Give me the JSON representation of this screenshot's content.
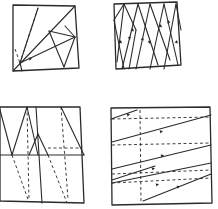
{
  "canvas": {
    "width": 218,
    "height": 209,
    "background": "#ffffff",
    "ink": "#2a2a2a"
  },
  "panels": [
    {
      "id": "top-left",
      "outline": [
        [
          13,
          5
        ],
        [
          75,
          6
        ],
        [
          79,
          68
        ],
        [
          13,
          71
        ]
      ],
      "solid": [
        [
          [
            13,
            71
          ],
          [
            75,
            6
          ]
        ],
        [
          [
            20,
            63
          ],
          [
            38,
            8
          ]
        ],
        [
          [
            49,
            31
          ],
          [
            75,
            37
          ]
        ],
        [
          [
            49,
            31
          ],
          [
            64,
            67
          ]
        ],
        [
          [
            20,
            63
          ],
          [
            75,
            37
          ]
        ],
        [
          [
            75,
            37
          ],
          [
            64,
            67
          ]
        ],
        [
          [
            65,
            26
          ],
          [
            75,
            37
          ]
        ],
        [
          [
            20,
            63
          ],
          [
            22,
            71
          ]
        ]
      ],
      "dashed": [
        [
          [
            38,
            8
          ],
          [
            20,
            63
          ]
        ],
        [
          [
            15,
            49
          ],
          [
            20,
            63
          ]
        ]
      ],
      "arrows": [
        [
          [
            24,
            61
          ],
          [
            32,
            58
          ]
        ]
      ]
    },
    {
      "id": "top-right",
      "outline": [
        [
          114,
          4
        ],
        [
          177,
          2
        ],
        [
          181,
          65
        ],
        [
          116,
          69
        ]
      ],
      "solid": [
        [
          [
            114,
            20
          ],
          [
            124,
            4
          ]
        ],
        [
          [
            114,
            20
          ],
          [
            124,
            69
          ]
        ],
        [
          [
            124,
            4
          ],
          [
            136,
            30
          ]
        ],
        [
          [
            136,
            30
          ],
          [
            129,
            69
          ]
        ],
        [
          [
            124,
            4
          ],
          [
            117,
            62
          ]
        ],
        [
          [
            138,
            4
          ],
          [
            122,
            69
          ]
        ],
        [
          [
            138,
            4
          ],
          [
            158,
            65
          ]
        ],
        [
          [
            150,
            4
          ],
          [
            136,
            69
          ]
        ],
        [
          [
            150,
            4
          ],
          [
            170,
            60
          ]
        ],
        [
          [
            164,
            4
          ],
          [
            150,
            69
          ]
        ],
        [
          [
            164,
            4
          ],
          [
            178,
            65
          ]
        ],
        [
          [
            176,
            4
          ],
          [
            164,
            69
          ]
        ],
        [
          [
            176,
            4
          ],
          [
            181,
            30
          ]
        ]
      ],
      "dashed": [],
      "arrows": [
        [
          [
            119,
            48
          ],
          [
            121,
            40
          ]
        ],
        [
          [
            128,
            32
          ],
          [
            130,
            40
          ]
        ],
        [
          [
            131,
            36
          ],
          [
            133,
            28
          ]
        ],
        [
          [
            141,
            45
          ],
          [
            143,
            37
          ]
        ],
        [
          [
            159,
            32
          ],
          [
            161,
            24
          ]
        ],
        [
          [
            148,
            36
          ],
          [
            150,
            44
          ]
        ],
        [
          [
            175,
            48
          ],
          [
            177,
            40
          ]
        ],
        [
          [
            170,
            28
          ],
          [
            168,
            20
          ]
        ]
      ]
    },
    {
      "id": "bottom-left",
      "outline": [
        [
          0,
          107
        ],
        [
          80,
          107
        ],
        [
          84,
          203
        ],
        [
          0,
          201
        ]
      ],
      "solid": [
        [
          [
            0,
            155
          ],
          [
            84,
            155
          ]
        ],
        [
          [
            0,
            110
          ],
          [
            12,
            155
          ]
        ],
        [
          [
            12,
            155
          ],
          [
            27,
            107
          ]
        ],
        [
          [
            27,
            107
          ],
          [
            38,
            155
          ]
        ],
        [
          [
            38,
            134
          ],
          [
            48,
            155
          ]
        ],
        [
          [
            38,
            134
          ],
          [
            29,
            155
          ]
        ],
        [
          [
            36,
            107
          ],
          [
            42,
            203
          ]
        ],
        [
          [
            61,
            107
          ],
          [
            84,
            155
          ]
        ]
      ],
      "dashed": [
        [
          [
            12,
            155
          ],
          [
            29,
            202
          ]
        ],
        [
          [
            48,
            155
          ],
          [
            67,
            203
          ]
        ],
        [
          [
            61,
            107
          ],
          [
            68,
            199
          ]
        ],
        [
          [
            48,
            148
          ],
          [
            82,
            148
          ]
        ],
        [
          [
            27,
            107
          ],
          [
            29,
            200
          ]
        ]
      ],
      "arrows": []
    },
    {
      "id": "bottom-right",
      "outline": [
        [
          111,
          108
        ],
        [
          210,
          107
        ],
        [
          212,
          203
        ],
        [
          112,
          205
        ]
      ],
      "solid": [
        [
          [
            111,
            119
          ],
          [
            137,
            110
          ]
        ],
        [
          [
            112,
            142
          ],
          [
            211,
            115
          ]
        ],
        [
          [
            112,
            169
          ],
          [
            211,
            145
          ]
        ],
        [
          [
            112,
            180
          ],
          [
            155,
            166
          ]
        ],
        [
          [
            112,
            183
          ],
          [
            211,
            163
          ]
        ],
        [
          [
            143,
            201
          ],
          [
            211,
            174
          ]
        ]
      ],
      "dashed": [
        [
          [
            140,
            110
          ],
          [
            141,
            203
          ]
        ],
        [
          [
            112,
            119
          ],
          [
            211,
            117
          ]
        ],
        [
          [
            112,
            145
          ],
          [
            211,
            143
          ]
        ],
        [
          [
            112,
            174
          ],
          [
            211,
            170
          ]
        ],
        [
          [
            112,
            183
          ],
          [
            211,
            178
          ]
        ]
      ],
      "arrows": [
        [
          [
            122,
            117
          ],
          [
            130,
            114
          ]
        ],
        [
          [
            156,
            133
          ],
          [
            163,
            131
          ]
        ],
        [
          [
            156,
            158
          ],
          [
            164,
            155
          ]
        ],
        [
          [
            149,
            170
          ],
          [
            155,
            168
          ]
        ],
        [
          [
            153,
            186
          ],
          [
            159,
            184
          ]
        ],
        [
          [
            173,
            189
          ],
          [
            180,
            186
          ]
        ]
      ]
    }
  ]
}
